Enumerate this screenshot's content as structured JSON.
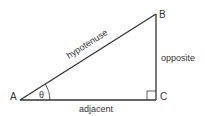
{
  "diagram": {
    "type": "right-triangle",
    "colors": {
      "line": "#333333",
      "text": "#333333",
      "background": "#ffffff"
    },
    "vertices": {
      "A": {
        "label": "A"
      },
      "B": {
        "label": "B"
      },
      "C": {
        "label": "C"
      }
    },
    "angle": {
      "symbol": "θ"
    },
    "sides": {
      "hypotenuse": "hypotenuse",
      "opposite": "opposite",
      "adjacent": "adjacent"
    }
  }
}
